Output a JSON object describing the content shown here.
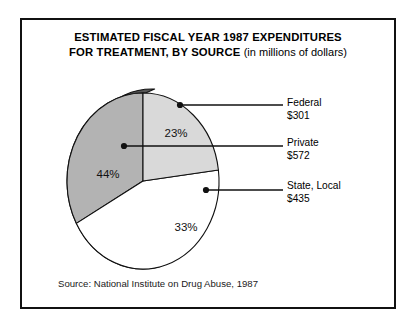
{
  "figure": {
    "title_line1": "ESTIMATED FISCAL YEAR 1987 EXPENDITURES",
    "title_line2": "FOR TREATMENT, BY SOURCE",
    "title_sub": "(in millions of dollars)",
    "source": "Source:  National Institute on Drug Abuse, 1987"
  },
  "legend": {
    "federal": {
      "name": "Federal",
      "value": "$301"
    },
    "private": {
      "name": "Private",
      "value": "$572"
    },
    "state": {
      "name": "State, Local",
      "value": "$435"
    }
  },
  "labels": {
    "federal_pct": "23%",
    "private_pct": "44%",
    "state_pct": "33%"
  },
  "colors": {
    "federal_slice": "#d9d9d9",
    "private_slice": "#ffffff",
    "state_slice": "#b3b3b3",
    "side_wall": "#555555",
    "outline": "#111111",
    "frame": "#111111"
  },
  "chart_data": {
    "type": "pie",
    "title": "ESTIMATED FISCAL YEAR 1987 EXPENDITURES FOR TREATMENT, BY SOURCE (in millions of dollars)",
    "unit": "millions of dollars",
    "categories": [
      "Federal",
      "Private",
      "State, Local"
    ],
    "values": [
      301,
      572,
      435
    ],
    "percentages": [
      23,
      44,
      33
    ],
    "labels": [
      "23%",
      "44%",
      "33%"
    ],
    "total": 1308,
    "start_angle_deg": 0,
    "direction": "clockwise",
    "legend_position": "right",
    "three_d": true,
    "slice_colors": [
      "#d9d9d9",
      "#ffffff",
      "#b3b3b3"
    ],
    "source": "National Institute on Drug Abuse, 1987"
  }
}
